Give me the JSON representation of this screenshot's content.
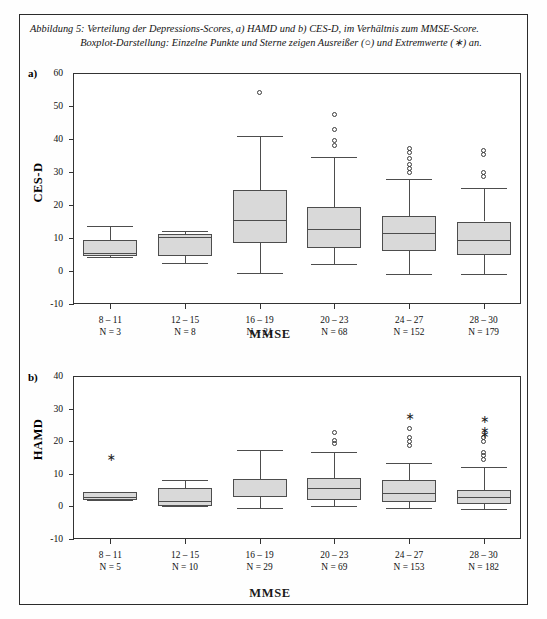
{
  "figure": {
    "caption_line1": "Abbildung 5: Verteilung der Depressions-Scores, a) HAMD und b) CES-D, im Verhältnis zum MMSE-Score.",
    "caption_line2": "Boxplot-Darstellung: Einzelne Punkte und Sterne zeigen Ausreißer (○) und Extremwerte (∗) an.",
    "panel_a_letter": "a)",
    "panel_b_letter": "b)",
    "box_fill_color": "#d9d9d9",
    "line_color": "#4d4d4d",
    "frame_color": "#333333"
  },
  "chart_data": [
    {
      "type": "box",
      "panel": "a",
      "title": "",
      "ylabel": "CES-D",
      "xlabel": "MMSE",
      "ylim": [
        -10,
        60
      ],
      "yticks": [
        60,
        50,
        40,
        30,
        20,
        10,
        0,
        -10
      ],
      "ytick_labels": [
        "60",
        "50",
        "40",
        "30",
        "20",
        "10",
        "0",
        "-10"
      ],
      "grid": false,
      "categories": [
        "8 – 11",
        "12 – 15",
        "16 – 19",
        "20 – 23",
        "24 – 27",
        "28 – 30"
      ],
      "counts": [
        "N = 3",
        "N = 8",
        "N = 21",
        "N = 68",
        "N = 152",
        "N = 179"
      ],
      "boxes": [
        {
          "category": "8 – 11",
          "n": 3,
          "whisker_low": 4.3,
          "q1": 4.5,
          "median": 5.5,
          "q3": 9.5,
          "whisker_high": 13.5,
          "outliers": [],
          "extremes": []
        },
        {
          "category": "12 – 15",
          "n": 8,
          "whisker_low": 2.5,
          "q1": 4.5,
          "median": 10.2,
          "q3": 11.2,
          "whisker_high": 12.2,
          "outliers": [],
          "extremes": []
        },
        {
          "category": "16 – 19",
          "n": 21,
          "whisker_low": -0.5,
          "q1": 8.5,
          "median": 15.5,
          "q3": 24.5,
          "whisker_high": 40.8,
          "outliers": [
            54.2
          ],
          "extremes": []
        },
        {
          "category": "20 – 23",
          "n": 68,
          "whisker_low": 2.0,
          "q1": 7.0,
          "median": 12.8,
          "q3": 19.5,
          "whisker_high": 34.5,
          "outliers": [
            47.5,
            43.0,
            39.5,
            38.0
          ],
          "extremes": []
        },
        {
          "category": "24 – 27",
          "n": 152,
          "whisker_low": -0.8,
          "q1": 6.0,
          "median": 11.5,
          "q3": 16.8,
          "whisker_high": 27.8,
          "outliers": [
            37.0,
            35.8,
            34.0,
            32.3,
            31.0,
            29.7
          ],
          "extremes": []
        },
        {
          "category": "28 – 30",
          "n": 179,
          "whisker_low": -1.0,
          "q1": 5.0,
          "median": 9.5,
          "q3": 15.0,
          "whisker_high": 25.3,
          "outliers": [
            36.5,
            35.3,
            29.8,
            28.5
          ],
          "extremes": []
        }
      ]
    },
    {
      "type": "box",
      "panel": "b",
      "title": "",
      "ylabel": "HAMD",
      "xlabel": "MMSE",
      "ylim": [
        -10,
        40
      ],
      "yticks": [
        40,
        30,
        20,
        10,
        0,
        -10
      ],
      "ytick_labels": [
        "40",
        "30",
        "20",
        "10",
        "0",
        "-10"
      ],
      "grid": false,
      "categories": [
        "8 – 11",
        "12 – 15",
        "16 – 19",
        "20 – 23",
        "24 – 27",
        "28 – 30"
      ],
      "counts": [
        "N = 5",
        "N = 10",
        "N = 29",
        "N = 69",
        "N = 153",
        "N = 182"
      ],
      "boxes": [
        {
          "category": "8 – 11",
          "n": 5,
          "whisker_low": 2.0,
          "q1": 2.0,
          "median": 3.0,
          "q3": 4.3,
          "whisker_high": 4.3,
          "outliers": [],
          "extremes": [
            15.0
          ]
        },
        {
          "category": "12 – 15",
          "n": 10,
          "whisker_low": 0.0,
          "q1": 0.0,
          "median": 1.8,
          "q3": 5.7,
          "whisker_high": 8.2,
          "outliers": [],
          "extremes": []
        },
        {
          "category": "16 – 19",
          "n": 29,
          "whisker_low": -0.5,
          "q1": 2.8,
          "median": 3.2,
          "q3": 8.3,
          "whisker_high": 17.3,
          "outliers": [],
          "extremes": []
        },
        {
          "category": "20 – 23",
          "n": 69,
          "whisker_low": 0.0,
          "q1": 2.0,
          "median": 5.5,
          "q3": 8.8,
          "whisker_high": 16.8,
          "outliers": [
            22.8,
            20.3,
            19.4
          ],
          "extremes": []
        },
        {
          "category": "24 – 27",
          "n": 153,
          "whisker_low": -0.5,
          "q1": 1.5,
          "median": 4.0,
          "q3": 8.0,
          "whisker_high": 13.2,
          "outliers": [
            24.0,
            21.0,
            20.0,
            18.7
          ],
          "extremes": [
            27.5
          ]
        },
        {
          "category": "28 – 30",
          "n": 182,
          "whisker_low": -0.8,
          "q1": 0.8,
          "median": 2.8,
          "q3": 5.0,
          "whisker_high": 12.0,
          "outliers": [
            21.0,
            20.0,
            16.5,
            15.5,
            14.5
          ],
          "extremes": [
            26.5,
            23.0,
            21.8
          ]
        }
      ]
    }
  ]
}
